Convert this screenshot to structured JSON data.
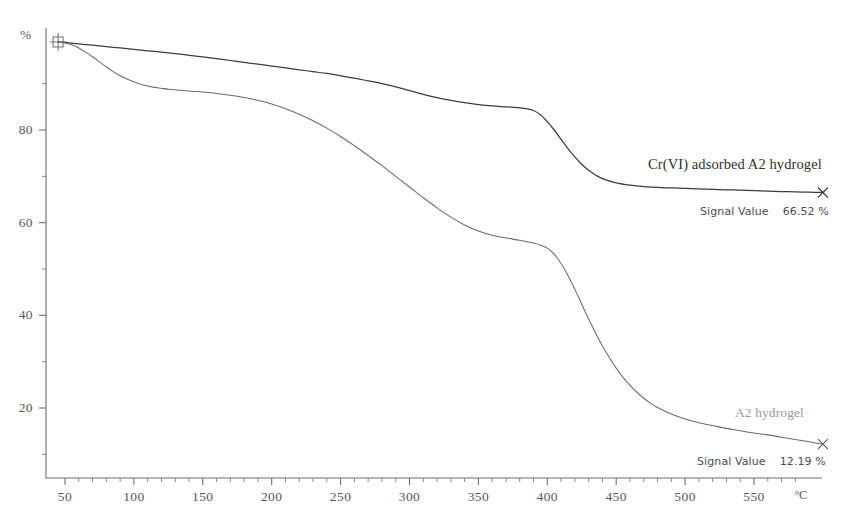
{
  "chart_data": {
    "type": "line",
    "title": "",
    "subtitle": "",
    "xlabel": "ºC",
    "ylabel": "%",
    "xlim": [
      40,
      600
    ],
    "ylim": [
      0,
      102
    ],
    "grid": false,
    "legend_position": "inline-right",
    "x_ticks": [
      50,
      100,
      150,
      200,
      250,
      300,
      350,
      400,
      450,
      500,
      550
    ],
    "x_tick_labels": [
      "50",
      "100",
      "150",
      "200",
      "250",
      "300",
      "350",
      "400",
      "450",
      "500",
      "550"
    ],
    "x_minor_interval": 10,
    "y_ticks": [
      20,
      40,
      60,
      80
    ],
    "y_tick_labels": [
      "20",
      "40",
      "60",
      "80"
    ],
    "y_minor_ticks": [
      10,
      30,
      50,
      70,
      90
    ],
    "series": [
      {
        "name": "Cr(VI) adsorbed A2 hydrogel",
        "color": "#3d3d3d",
        "end_marker": "x",
        "signal_label": "Signal Value",
        "signal_value": "66.52 %",
        "x": [
          45,
          50,
          60,
          70,
          80,
          90,
          100,
          110,
          120,
          130,
          140,
          150,
          160,
          170,
          180,
          190,
          200,
          210,
          220,
          230,
          240,
          250,
          260,
          270,
          280,
          290,
          300,
          310,
          320,
          330,
          340,
          350,
          360,
          370,
          380,
          385,
          390,
          395,
          400,
          405,
          410,
          415,
          420,
          425,
          430,
          435,
          440,
          450,
          460,
          470,
          480,
          490,
          500,
          510,
          520,
          530,
          540,
          550,
          560,
          570,
          580,
          590,
          600
        ],
        "y": [
          99.0,
          98.9,
          98.6,
          98.3,
          98.0,
          97.7,
          97.4,
          97.1,
          96.8,
          96.5,
          96.1,
          95.8,
          95.4,
          95.0,
          94.6,
          94.2,
          93.8,
          93.4,
          93.0,
          92.6,
          92.2,
          91.7,
          91.2,
          90.6,
          90.0,
          89.3,
          88.5,
          87.7,
          87.0,
          86.4,
          85.9,
          85.5,
          85.2,
          85.0,
          84.8,
          84.6,
          84.2,
          83.3,
          81.8,
          80.0,
          78.0,
          76.0,
          74.2,
          72.6,
          71.3,
          70.3,
          69.5,
          68.6,
          68.1,
          67.8,
          67.6,
          67.5,
          67.4,
          67.3,
          67.2,
          67.1,
          67.0,
          66.9,
          66.8,
          66.7,
          66.65,
          66.58,
          66.52
        ]
      },
      {
        "name": "A2 hydrogel",
        "color": "#6b6b6b",
        "end_marker": "x",
        "signal_label": "Signal Value",
        "signal_value": "12.19 %",
        "x": [
          45,
          50,
          55,
          60,
          65,
          70,
          75,
          80,
          85,
          90,
          95,
          100,
          105,
          110,
          115,
          120,
          125,
          130,
          140,
          150,
          160,
          170,
          180,
          190,
          200,
          210,
          220,
          230,
          240,
          250,
          260,
          270,
          280,
          290,
          300,
          310,
          320,
          330,
          340,
          350,
          360,
          370,
          380,
          390,
          395,
          400,
          405,
          410,
          415,
          420,
          425,
          430,
          435,
          440,
          445,
          450,
          455,
          460,
          465,
          470,
          475,
          480,
          490,
          500,
          510,
          520,
          530,
          540,
          550,
          560,
          570,
          580,
          590,
          600
        ],
        "y": [
          99.0,
          98.8,
          98.4,
          97.7,
          96.8,
          95.8,
          94.7,
          93.6,
          92.6,
          91.7,
          91.0,
          90.4,
          89.9,
          89.5,
          89.2,
          89.0,
          88.8,
          88.7,
          88.4,
          88.2,
          87.9,
          87.5,
          87.0,
          86.4,
          85.6,
          84.6,
          83.4,
          82.0,
          80.4,
          78.6,
          76.6,
          74.5,
          72.3,
          70.0,
          67.7,
          65.4,
          63.2,
          61.2,
          59.5,
          58.2,
          57.3,
          56.7,
          56.2,
          55.6,
          55.2,
          54.5,
          53.2,
          51.2,
          48.6,
          45.6,
          42.4,
          39.2,
          36.2,
          33.4,
          30.9,
          28.6,
          26.6,
          24.9,
          23.4,
          22.1,
          21.0,
          20.1,
          18.7,
          17.6,
          16.8,
          16.2,
          15.6,
          15.1,
          14.6,
          14.2,
          13.7,
          13.2,
          12.7,
          12.19
        ]
      }
    ]
  },
  "axes": {
    "y_unit": "%",
    "x_unit": "ºC"
  },
  "annotations": {
    "upper_series_label": "Cr(VI) adsorbed A2 hydrogel",
    "upper_signal_label": "Signal Value",
    "upper_signal_value": "66.52 %",
    "lower_series_label": "A2 hydrogel",
    "lower_signal_label": "Signal Value",
    "lower_signal_value": "12.19 %"
  },
  "colors": {
    "upper_curve": "#3d3d3d",
    "lower_curve": "#6b6b6b",
    "axis": "#6f6f6f",
    "text": "#525252",
    "faint_text": "#9a9a9a",
    "background": "#ffffff"
  }
}
